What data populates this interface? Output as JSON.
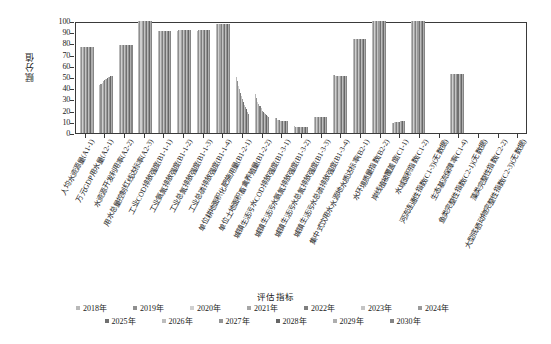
{
  "chart_data": {
    "type": "bar",
    "title": "",
    "xlabel": "评估指标",
    "ylabel": "赋分值",
    "ylim": [
      0,
      100
    ],
    "yticks": [
      0,
      10,
      20,
      30,
      40,
      50,
      60,
      70,
      80,
      90,
      100
    ],
    "grid": false,
    "legend_position": "bottom",
    "legend_title": "评估指标",
    "categories": [
      "人均水资源量(A1-1)",
      "万元GDP用水量(A2-1)",
      "水资源开发利用率(A2-2)",
      "用水总量控制红线达标率(A2-3)",
      "工业COD排放强度(B1-1-1)",
      "工业氨氮排放强度(B1-1-2)",
      "工业总氮排放强度(B1-1-3)",
      "工业总磷排放强度(B1-1-4)",
      "单位耕地面积化肥施用量(B1-2-1)",
      "单位土地面积畜禽养殖量(B1-2-2)",
      "城镇生活污水COD排放强度(B1-3-1)",
      "城镇生活污水氨氮排放强度(B1-3-2)",
      "城镇生活污水总氮排放强度(B1-3-3)",
      "城镇生活污水总磷排放强度(B1-3-4)",
      "集中式饮用水水源地水质达标率(B2-1)",
      "水环境质量指数(B2-2)",
      "岸线植被覆盖度(C1-1)",
      "水域面积指数(C1-2)",
      "河流连通性指数(C1-3)(无数据)",
      "生态基流保障率(C1-4)",
      "鱼类完整性指数(C2-1)(无数据)",
      "藻类完整性指数(C2-2)",
      "大型底栖动物完整性指数(C2-3)(无数据)"
    ],
    "series": [
      {
        "name": "2018年",
        "values": [
          77,
          43,
          79,
          100,
          91,
          91,
          91,
          97,
          50,
          35,
          13,
          6,
          14,
          52,
          84,
          100,
          9,
          100,
          0,
          53,
          0,
          0,
          0
        ]
      },
      {
        "name": "2019年",
        "values": [
          77,
          44,
          79,
          100,
          91,
          92,
          92,
          97,
          46,
          31,
          13,
          5,
          14,
          52,
          84,
          100,
          9,
          100,
          0,
          53,
          0,
          0,
          0
        ]
      },
      {
        "name": "2020年",
        "values": [
          77,
          45,
          79,
          100,
          91,
          92,
          92,
          97,
          42,
          28,
          12,
          5,
          14,
          51,
          84,
          100,
          10,
          100,
          0,
          53,
          0,
          0,
          0
        ]
      },
      {
        "name": "2021年",
        "values": [
          77,
          46,
          79,
          100,
          91,
          92,
          92,
          97,
          39,
          26,
          12,
          5,
          14,
          51,
          84,
          100,
          10,
          100,
          0,
          53,
          0,
          0,
          0
        ]
      },
      {
        "name": "2022年",
        "values": [
          77,
          47,
          79,
          100,
          91,
          92,
          92,
          97,
          36,
          24,
          12,
          5,
          14,
          51,
          84,
          100,
          10,
          100,
          0,
          53,
          0,
          0,
          0
        ]
      },
      {
        "name": "2023年",
        "values": [
          77,
          48,
          79,
          100,
          91,
          92,
          92,
          97,
          33,
          22,
          11,
          5,
          14,
          51,
          84,
          100,
          10,
          100,
          0,
          53,
          0,
          0,
          0
        ]
      },
      {
        "name": "2024年",
        "values": [
          77,
          48,
          79,
          100,
          91,
          92,
          92,
          97,
          30,
          20,
          11,
          5,
          14,
          51,
          84,
          100,
          10,
          100,
          0,
          53,
          0,
          0,
          0
        ]
      },
      {
        "name": "2025年",
        "values": [
          77,
          49,
          79,
          100,
          91,
          92,
          92,
          97,
          28,
          19,
          11,
          5,
          14,
          51,
          84,
          100,
          10,
          100,
          0,
          53,
          0,
          0,
          0
        ]
      },
      {
        "name": "2026年",
        "values": [
          77,
          50,
          79,
          100,
          91,
          92,
          92,
          97,
          25,
          18,
          11,
          5,
          14,
          51,
          84,
          100,
          11,
          100,
          0,
          53,
          0,
          0,
          0
        ]
      },
      {
        "name": "2027年",
        "values": [
          77,
          50,
          79,
          100,
          91,
          92,
          92,
          97,
          23,
          17,
          11,
          5,
          14,
          51,
          84,
          100,
          11,
          100,
          0,
          53,
          0,
          0,
          0
        ]
      },
      {
        "name": "2028年",
        "values": [
          77,
          51,
          79,
          100,
          91,
          92,
          92,
          97,
          21,
          16,
          11,
          5,
          14,
          51,
          84,
          100,
          11,
          100,
          0,
          53,
          0,
          0,
          0
        ]
      },
      {
        "name": "2029年",
        "values": [
          77,
          51,
          79,
          100,
          91,
          92,
          92,
          97,
          19,
          15,
          11,
          5,
          14,
          51,
          84,
          100,
          11,
          100,
          0,
          53,
          0,
          0,
          0
        ]
      },
      {
        "name": "2030年",
        "values": [
          77,
          51,
          79,
          100,
          91,
          92,
          92,
          97,
          17,
          14,
          11,
          5,
          14,
          51,
          84,
          100,
          11,
          100,
          0,
          53,
          0,
          0,
          0
        ]
      }
    ],
    "series_colors": [
      "#b9b9b9",
      "#8f8f8f",
      "#cfcfcf",
      "#a6a6a6",
      "#7e7e7e",
      "#c4c4c4",
      "#9a9a9a",
      "#707070",
      "#bdbdbd",
      "#949494",
      "#666666",
      "#aeaeae",
      "#858585"
    ]
  }
}
